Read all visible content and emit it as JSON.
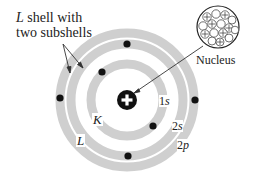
{
  "diagram": {
    "title_label": {
      "line1_italic": "L",
      "line1_rest": " shell with",
      "line2": "two subshells"
    },
    "nucleus_label": "Nucleus",
    "shell_labels": {
      "k": "K",
      "l": "L"
    },
    "subshell_labels": [
      {
        "num": "1",
        "letter": "s"
      },
      {
        "num": "2",
        "letter": "s"
      },
      {
        "num": "2",
        "letter": "p"
      }
    ],
    "nucleus_symbol": "+",
    "colors": {
      "ring": "#cfcfcf",
      "electron": "#111111",
      "nucleus": "#111111",
      "arrow": "#333333"
    },
    "electron_count": 6
  }
}
